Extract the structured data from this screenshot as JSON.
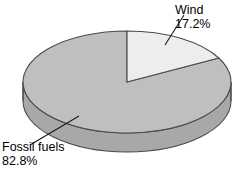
{
  "chart_data": {
    "type": "pie",
    "title": "",
    "subtitle": "",
    "xlabel": "",
    "ylabel": "",
    "legend_position": "none",
    "grid": false,
    "three_d": true,
    "start_angle_deg": 0,
    "direction": "clockwise",
    "categories": [
      "Wind",
      "Fossil fuels"
    ],
    "values": [
      17.2,
      82.8
    ],
    "value_unit": "%",
    "slices": [
      {
        "name": "Wind",
        "value": 17.2,
        "value_label": "17.2%",
        "color": "#ededed",
        "side_color": "#d2d2d2",
        "start_deg": 0,
        "end_deg": 61.92
      },
      {
        "name": "Fossil fuels",
        "value": 82.8,
        "value_label": "82.8%",
        "color": "#bfbfbf",
        "side_color": "#a8a8a8",
        "start_deg": 61.92,
        "end_deg": 360
      }
    ]
  },
  "labels": {
    "wind": {
      "name": "Wind",
      "percent": "17.2%"
    },
    "fossil": {
      "name": "Fossil fuels",
      "percent": "82.8%"
    }
  },
  "colors": {
    "wind_slice": "#ededed",
    "fossil_slice": "#bfbfbf",
    "side_wall": "#a8a8a8",
    "outline": "#4a4a4a",
    "background": "#ffffff",
    "text": "#000000"
  },
  "geometry": {
    "center_x": 127,
    "center_y": 82,
    "radius_x": 104,
    "radius_y": 51,
    "depth": 19
  }
}
